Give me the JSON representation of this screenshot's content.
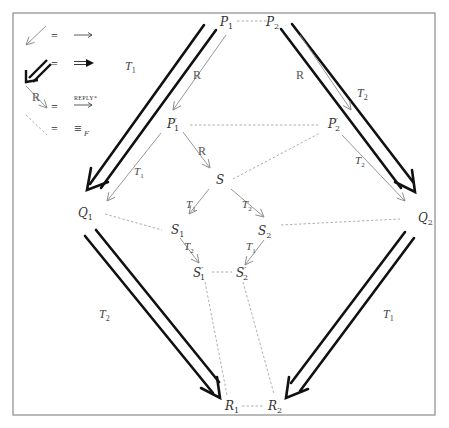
{
  "legend": [
    {
      "symbol": "thin-arrow",
      "equals": "=",
      "meaning": "⟶"
    },
    {
      "symbol": "double-arrow",
      "equals": "=",
      "meaning": "⟹"
    },
    {
      "symbol": "reply-arrow",
      "arrow_label": "R",
      "equals": "=",
      "meaning_label": "REPLY*",
      "meaning": "⟶"
    },
    {
      "symbol": "dashed-line",
      "equals": "=",
      "meaning": "≡",
      "meaning_sub": "F"
    }
  ],
  "nodes": {
    "P1": {
      "base": "P",
      "sub": "1",
      "prime": ""
    },
    "P2": {
      "base": "P",
      "sub": "2",
      "prime": ""
    },
    "P1p": {
      "base": "P",
      "sub": "1",
      "prime": "′"
    },
    "P2p": {
      "base": "P",
      "sub": "2",
      "prime": "′"
    },
    "S": {
      "base": "S",
      "sub": "",
      "prime": ""
    },
    "Q1": {
      "base": "Q",
      "sub": "1",
      "prime": ""
    },
    "Q2": {
      "base": "Q",
      "sub": "2",
      "prime": ""
    },
    "S1": {
      "base": "S",
      "sub": "1",
      "prime": ""
    },
    "S2": {
      "base": "S",
      "sub": "2",
      "prime": ""
    },
    "S1p": {
      "base": "S",
      "sub": "1",
      "prime": "′"
    },
    "S2p": {
      "base": "S",
      "sub": "2",
      "prime": "′"
    },
    "R1": {
      "base": "R",
      "sub": "1",
      "prime": ""
    },
    "R2": {
      "base": "R",
      "sub": "2",
      "prime": ""
    }
  },
  "edge_labels": {
    "big_T1_top_left": {
      "base": "T",
      "sub": "1"
    },
    "big_T2_top_right": {
      "base": "T",
      "sub": "2"
    },
    "big_T2_bottom_left": {
      "base": "T",
      "sub": "2"
    },
    "big_T1_bottom_right": {
      "base": "T",
      "sub": "1"
    },
    "R_P1_P1p": "R",
    "R_P2_P2p": "R",
    "R_P1p_S": "R",
    "T1_P1p_Q1": {
      "base": "T",
      "sub": "1"
    },
    "T2_P2p_Q2": {
      "base": "T",
      "sub": "2"
    },
    "T1_S_S1": {
      "base": "T",
      "sub": "1"
    },
    "T2_S_S2": {
      "base": "T",
      "sub": "2"
    },
    "T2_S1_S1p": {
      "base": "T",
      "sub": "2"
    },
    "T1_S2_S2p": {
      "base": "T",
      "sub": "1"
    }
  },
  "colors": {
    "frame": "#888888",
    "thick_arrow": "#111111",
    "thin_arrow": "#8a8a8a",
    "dashed": "#9a9a9a"
  }
}
